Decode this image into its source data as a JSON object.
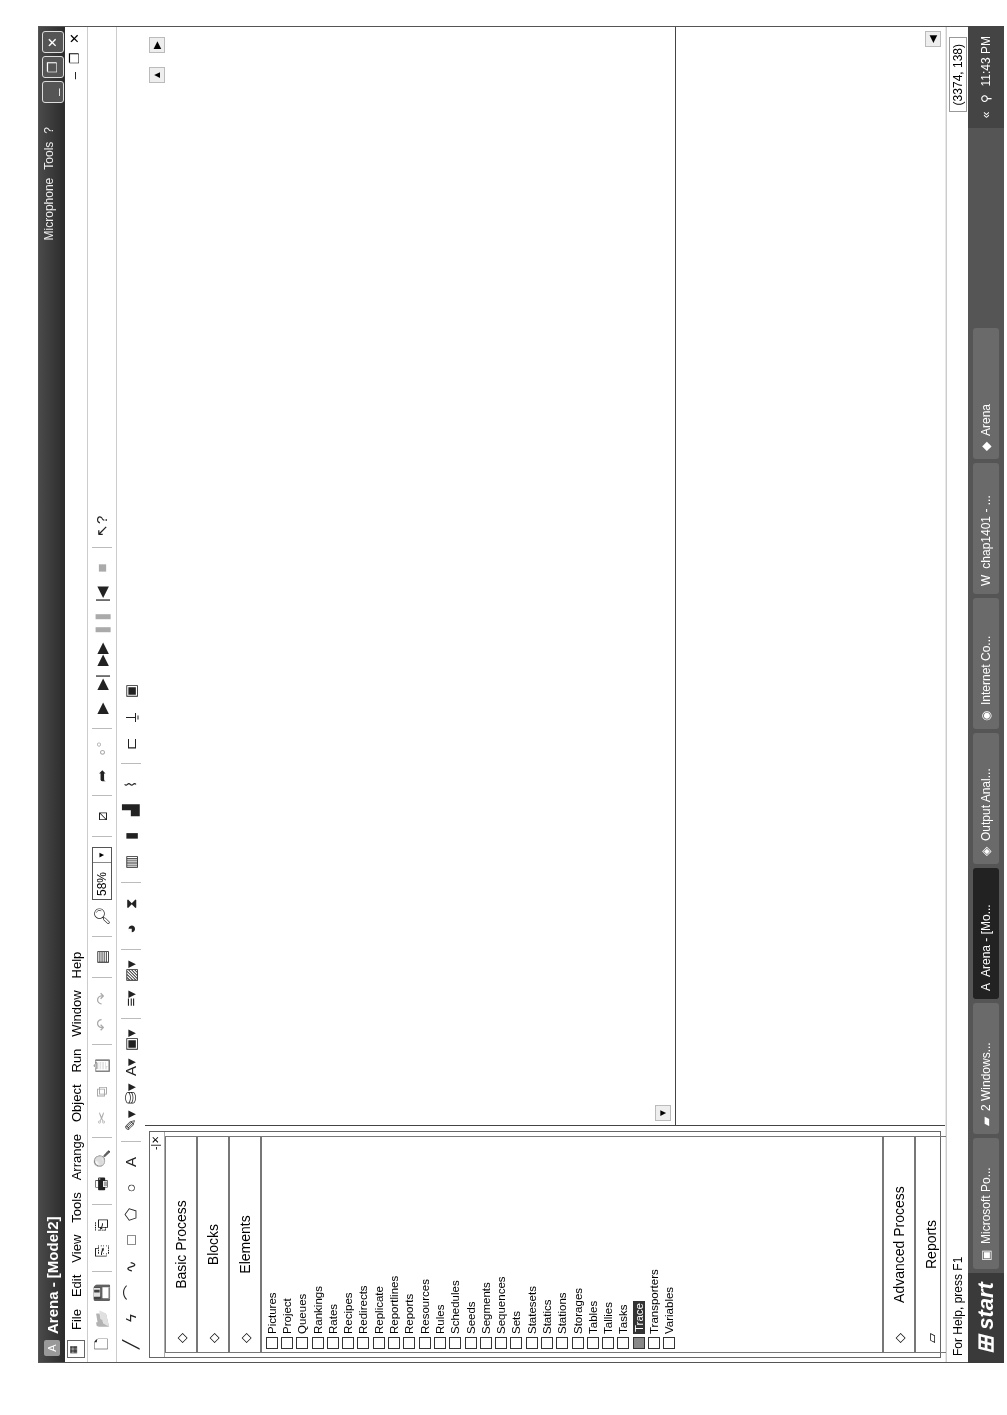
{
  "window": {
    "title": "Arena - [Model2]",
    "language_bar": {
      "microphone": "Microphone",
      "tools": "Tools"
    },
    "controls": [
      "minimize",
      "restore",
      "close"
    ]
  },
  "menubar": {
    "items": [
      "File",
      "Edit",
      "View",
      "Tools",
      "Arrange",
      "Object",
      "Run",
      "Window",
      "Help"
    ]
  },
  "toolbar_standard": {
    "zoom_value": "58%",
    "buttons": [
      "new-icon",
      "open-icon",
      "save-icon",
      "attach-icon",
      "detach-icon",
      "print-icon",
      "print-preview-icon",
      "cut-icon",
      "copy-icon",
      "paste-icon",
      "undo-icon",
      "redo-icon",
      "layers-icon",
      "zoom-icon",
      "split-screen-icon",
      "connect-icon",
      "animate-connector-icon",
      "go-icon",
      "step-icon",
      "fast-forward-icon",
      "pause-icon",
      "start-over-icon",
      "end-icon",
      "help-pointer-icon"
    ]
  },
  "toolbar_draw": {
    "buttons": [
      "line-icon",
      "polyline-icon",
      "arc-icon",
      "bezier-icon",
      "box-icon",
      "polygon-icon",
      "ellipse-icon",
      "text-icon",
      "line-color-icon",
      "fill-color-icon",
      "text-color-icon",
      "window-bg-color-icon",
      "line-style-icon",
      "fill-pattern-icon",
      "clock-icon",
      "date-icon",
      "variable-icon",
      "level-icon",
      "histogram-icon",
      "plot-icon",
      "queue-icon",
      "resource-icon",
      "global-icon"
    ]
  },
  "project_bar": {
    "panels_top": [
      {
        "label": "Basic Process"
      },
      {
        "label": "Blocks"
      },
      {
        "label": "Elements"
      }
    ],
    "elements": [
      "Pictures",
      "Project",
      "Queues",
      "Rankings",
      "Rates",
      "Recipes",
      "Redirects",
      "Replicate",
      "Reportlines",
      "Reports",
      "Resources",
      "Rules",
      "Schedules",
      "Seeds",
      "Segments",
      "Sequences",
      "Sets",
      "Statesets",
      "Statics",
      "Stations",
      "Storages",
      "Tables",
      "Tallies",
      "Tasks",
      "Trace",
      "Transporters",
      "Variables"
    ],
    "selected_element": "Trace",
    "panels_bottom": [
      {
        "label": "Advanced Process"
      },
      {
        "label": "Reports"
      },
      {
        "label": "Navigate"
      }
    ]
  },
  "statusbar": {
    "help_text": "For Help, press F1",
    "coordinates": "(3374, 138)"
  },
  "taskbar": {
    "start_label": "start",
    "tasks": [
      {
        "label": "Microsoft Po..."
      },
      {
        "label": "2 Windows..."
      },
      {
        "label": "Arena - [Mo...",
        "active": true
      },
      {
        "label": "Output Anal..."
      },
      {
        "label": "Internet Co..."
      },
      {
        "label": "chap1401 - ..."
      },
      {
        "label": "Arena"
      }
    ],
    "clock": "11:43 PM"
  }
}
